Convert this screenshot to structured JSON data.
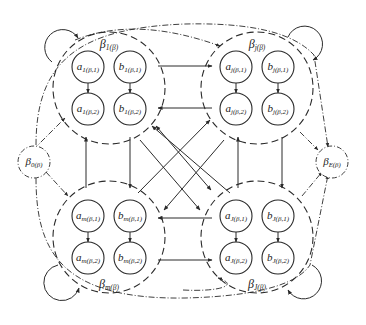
{
  "diagram": {
    "colors": {
      "stroke": "#2a2a2a",
      "background": "#ffffff"
    },
    "clusters": [
      {
        "id": "top-left",
        "label_main": "β",
        "label_sub": "1(β)",
        "nodes": [
          {
            "main": "a",
            "sub": "1(β,1)"
          },
          {
            "main": "b",
            "sub": "1(β,1)"
          },
          {
            "main": "a",
            "sub": "1(β,2)"
          },
          {
            "main": "b",
            "sub": "1(β,2)"
          }
        ]
      },
      {
        "id": "top-right",
        "label_main": "β",
        "label_sub": "j(β)",
        "nodes": [
          {
            "main": "a",
            "sub": "j(β,1)"
          },
          {
            "main": "b",
            "sub": "j(β,1)"
          },
          {
            "main": "a",
            "sub": "j(β,2)"
          },
          {
            "main": "b",
            "sub": "j(β,2)"
          }
        ]
      },
      {
        "id": "bottom-left",
        "label_main": "β",
        "label_sub": "m(β)",
        "nodes": [
          {
            "main": "a",
            "sub": "m(β,1)"
          },
          {
            "main": "b",
            "sub": "m(β,1)"
          },
          {
            "main": "a",
            "sub": "m(β,2)"
          },
          {
            "main": "b",
            "sub": "m(β,2)"
          }
        ]
      },
      {
        "id": "bottom-right",
        "label_main": "β",
        "label_sub": "J(β)",
        "nodes": [
          {
            "main": "a",
            "sub": "J(β,1)"
          },
          {
            "main": "b",
            "sub": "J(β,1)"
          },
          {
            "main": "a",
            "sub": "J(β,2)"
          },
          {
            "main": "b",
            "sub": "J(β,2)"
          }
        ]
      }
    ],
    "start_node": {
      "label_main": "β",
      "label_sub": "0(β)"
    },
    "end_node": {
      "label_main": "β",
      "label_sub": "E(β)"
    }
  }
}
